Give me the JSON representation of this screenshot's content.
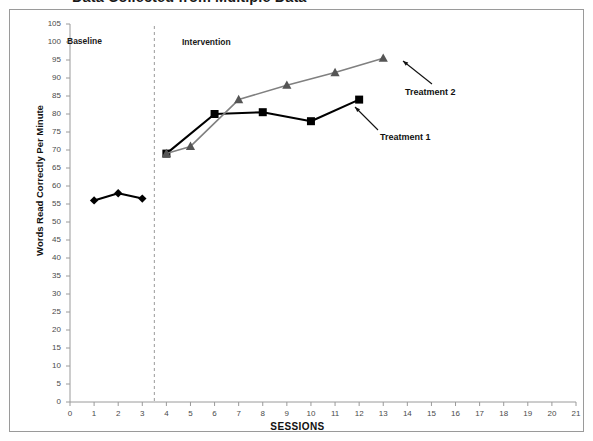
{
  "title": "Data Collected from Multiple Data",
  "chart_data": {
    "type": "line",
    "title": "Data Collected from Multiple Data",
    "xlabel": "SESSIONS",
    "ylabel": "Words Read Correctly Per Minute",
    "xlim": [
      0,
      21
    ],
    "ylim": [
      0,
      105
    ],
    "xticks": [
      0,
      1,
      2,
      3,
      4,
      5,
      6,
      7,
      8,
      9,
      10,
      11,
      12,
      13,
      14,
      15,
      16,
      17,
      18,
      19,
      20,
      21
    ],
    "yticks": [
      0,
      5,
      10,
      15,
      20,
      25,
      30,
      35,
      40,
      45,
      50,
      55,
      60,
      65,
      70,
      75,
      80,
      85,
      90,
      95,
      100,
      105
    ],
    "grid": false,
    "legend": "annotations",
    "phase_line": {
      "x": 3.5,
      "style": "dashed",
      "color": "#999999"
    },
    "phase_labels": [
      {
        "text": "Baseline",
        "x": 1.5
      },
      {
        "text": "Intervention",
        "x": 7.5
      }
    ],
    "annotations": [
      {
        "text": "Treatment 2",
        "points_to_series": "Treatment 2",
        "points_to_x": 13
      },
      {
        "text": "Treatment 1",
        "points_to_series": "Treatment 1",
        "points_to_x": 12
      }
    ],
    "series": [
      {
        "name": "Baseline",
        "color": "#000000",
        "marker": "diamond",
        "x": [
          1,
          2,
          3
        ],
        "values": [
          56,
          58,
          56.5
        ]
      },
      {
        "name": "Treatment 1",
        "color": "#000000",
        "marker": "square",
        "x": [
          4,
          6,
          8,
          10,
          12
        ],
        "values": [
          69,
          80,
          80.5,
          78,
          84
        ]
      },
      {
        "name": "Treatment 2",
        "color": "#808080",
        "marker": "triangle",
        "x": [
          4,
          5,
          7,
          9,
          11,
          13
        ],
        "values": [
          69,
          71,
          84,
          88,
          91.5,
          95.5
        ]
      }
    ]
  },
  "axis": {
    "y_title": "Words Read Correctly Per Minute",
    "x_title": "SESSIONS"
  },
  "labels": {
    "baseline": "Baseline",
    "intervention": "Intervention",
    "treatment_1": "Treatment 1",
    "treatment_2": "Treatment 2"
  }
}
